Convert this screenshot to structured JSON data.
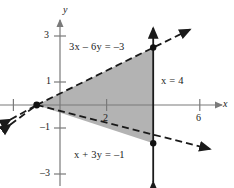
{
  "figure": {
    "type": "coordinate-plane-inequality-graph"
  },
  "axes": {
    "x_label": "x",
    "y_label": "y",
    "origin_px": [
      60,
      105
    ],
    "x_unit_px": 23.3,
    "y_unit_px": 23.0,
    "x_ticks": [
      {
        "value": 2,
        "label": "2"
      },
      {
        "value": 6,
        "label": "6"
      }
    ],
    "y_ticks": [
      {
        "value": 3,
        "label": "3"
      },
      {
        "value": 1,
        "label": "1"
      },
      {
        "value": -1,
        "label": "-1"
      },
      {
        "value": -3,
        "label": "-3"
      }
    ],
    "unlabeled_x_ticks": [
      -2
    ]
  },
  "lines": [
    {
      "id": "line-upper",
      "equation": "3x - 6y = -3",
      "label": "3x – 6y = –3",
      "style": "dashed",
      "slope": 0.5,
      "intercept": 0.5,
      "arrows": "both"
    },
    {
      "id": "line-lower",
      "equation": "x + 3y = -1",
      "label": "x + 3y = –1",
      "style": "dashed",
      "slope": -0.33333,
      "intercept": -0.33333,
      "arrows": "both"
    },
    {
      "id": "line-vertical",
      "equation": "x = 4",
      "label": "x = 4",
      "style": "solid",
      "vertical_x": 4,
      "arrows": "both"
    }
  ],
  "region": {
    "shaded": true,
    "fill_color": "#b0b0b0",
    "vertices": [
      {
        "x": -1,
        "y": 0
      },
      {
        "x": 4,
        "y": 2.5
      },
      {
        "x": 4,
        "y": -1.6667
      }
    ]
  },
  "points": [
    {
      "x": -1,
      "y": 0,
      "filled": true
    },
    {
      "x": 4,
      "y": 2.5,
      "filled": true
    },
    {
      "x": 4,
      "y": -1.6667,
      "filled": true
    }
  ],
  "colors": {
    "axis": "#7a7a7a",
    "line": "#1a1a1a",
    "shade": "#b3b3b3",
    "text": "#1a1a1a"
  },
  "labels": {
    "eq_upper": "3x – 6y = –3",
    "eq_lower": "x + 3y = –1",
    "eq_vertical": "x = 4",
    "axis_x": "x",
    "axis_y": "y",
    "tick_y_3": "3",
    "tick_y_1": "1",
    "tick_y_m1": "–1",
    "tick_y_m3": "–3",
    "tick_x_2": "2",
    "tick_x_6": "6"
  }
}
